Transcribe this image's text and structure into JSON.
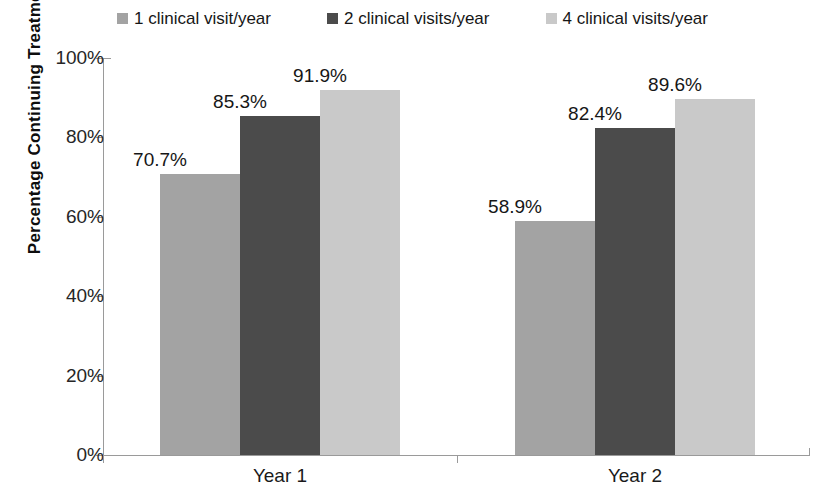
{
  "chart_data": {
    "type": "bar",
    "title": "",
    "subtitle": "",
    "xlabel": "",
    "ylabel": "Percentage Continuing Treatment",
    "categories": [
      "Year 1",
      "Year 2"
    ],
    "ylim": [
      0,
      100
    ],
    "ytick_labels": [
      "0%",
      "20%",
      "40%",
      "60%",
      "80%",
      "100%"
    ],
    "ytick_values": [
      0,
      20,
      40,
      60,
      80,
      100
    ],
    "grid": false,
    "legend_position": "top-center",
    "value_suffix": "%",
    "series": [
      {
        "name": "1 clinical visit/year",
        "color": "#a3a3a3",
        "values": [
          70.7,
          89.6
        ],
        "labels": [
          "70.7%",
          "58.9%"
        ],
        "actual_values": [
          70.7,
          58.9
        ]
      },
      {
        "name": "2 clinical visits/year",
        "color": "#4b4b4b",
        "values": [
          85.3,
          82.4
        ],
        "labels": [
          "85.3%",
          "82.4%"
        ],
        "actual_values": [
          85.3,
          82.4
        ]
      },
      {
        "name": "4 clinical visits/year",
        "color": "#c9c9c9",
        "values": [
          91.9,
          89.6
        ],
        "labels": [
          "91.9%",
          "89.6%"
        ],
        "actual_values": [
          91.9,
          89.6
        ]
      }
    ],
    "groups": [
      {
        "category": "Year 1",
        "bars": [
          {
            "series": "1 clinical visit/year",
            "value": 70.7,
            "label": "70.7%",
            "color": "#a3a3a3"
          },
          {
            "series": "2 clinical visits/year",
            "value": 85.3,
            "label": "85.3%",
            "color": "#4b4b4b"
          },
          {
            "series": "4 clinical visits/year",
            "value": 91.9,
            "label": "91.9%",
            "color": "#c9c9c9"
          }
        ]
      },
      {
        "category": "Year 2",
        "bars": [
          {
            "series": "1 clinical visit/year",
            "value": 58.9,
            "label": "58.9%",
            "color": "#a3a3a3"
          },
          {
            "series": "2 clinical visits/year",
            "value": 82.4,
            "label": "82.4%",
            "color": "#4b4b4b"
          },
          {
            "series": "4 clinical visits/year",
            "value": 89.6,
            "label": "89.6%",
            "color": "#c9c9c9"
          }
        ]
      }
    ]
  },
  "legend": {
    "items": [
      {
        "label": "1 clinical visit/year",
        "color": "#a3a3a3"
      },
      {
        "label": "2 clinical visits/year",
        "color": "#4b4b4b"
      },
      {
        "label": "4 clinical visits/year",
        "color": "#c9c9c9"
      }
    ]
  },
  "axes": {
    "y_title": "Percentage Continuing Treatment",
    "y_ticks": [
      "100%",
      "80%",
      "60%",
      "40%",
      "20%",
      "0%"
    ],
    "x_labels": [
      "Year 1",
      "Year 2"
    ],
    "axis_color": "#9a9a9a"
  }
}
